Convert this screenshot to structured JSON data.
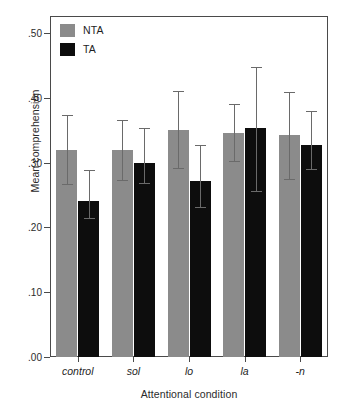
{
  "chart_data": {
    "type": "bar",
    "title": "",
    "subtitle": "",
    "xlabel": "Attentional condition",
    "ylabel": "Mean comprehension",
    "categories": [
      "control",
      "sol",
      "lo",
      "la",
      "-n"
    ],
    "ylim": [
      0.0,
      0.5
    ],
    "ytick_labels": [
      ".00",
      ".10",
      ".20",
      ".30",
      ".40",
      ".50"
    ],
    "ytick_values": [
      0.0,
      0.1,
      0.2,
      0.3,
      0.4,
      0.5
    ],
    "grid": false,
    "legend_position": "top-left",
    "legend_entries": [
      "NTA",
      "TA"
    ],
    "error_bars": "shown (whisker caps, asymmetric about mean)",
    "series": [
      {
        "name": "NTA",
        "color": "#8b8b8b",
        "values": [
          0.32,
          0.319,
          0.351,
          0.346,
          0.343
        ],
        "err_low": [
          0.267,
          0.273,
          0.291,
          0.302,
          0.275
        ],
        "err_high": [
          0.373,
          0.366,
          0.41,
          0.391,
          0.409
        ]
      },
      {
        "name": "TA",
        "color": "#0d0d0d",
        "values": [
          0.241,
          0.3,
          0.272,
          0.354,
          0.327
        ],
        "err_low": [
          0.215,
          0.268,
          0.232,
          0.256,
          0.29
        ],
        "err_high": [
          0.289,
          0.353,
          0.327,
          0.447,
          0.379
        ]
      }
    ]
  },
  "legend": {
    "items": [
      {
        "label": "NTA",
        "color": "#8b8b8b"
      },
      {
        "label": "TA",
        "color": "#0d0d0d"
      }
    ]
  },
  "axes": {
    "y_title": "Mean comprehension",
    "x_title": "Attentional condition"
  },
  "colors": {
    "nta": "#8b8b8b",
    "ta": "#0d0d0d",
    "frame": "#4a4a4a",
    "error": "#6a6a6a",
    "text": "#1e1e1e",
    "background": "#ffffff"
  }
}
